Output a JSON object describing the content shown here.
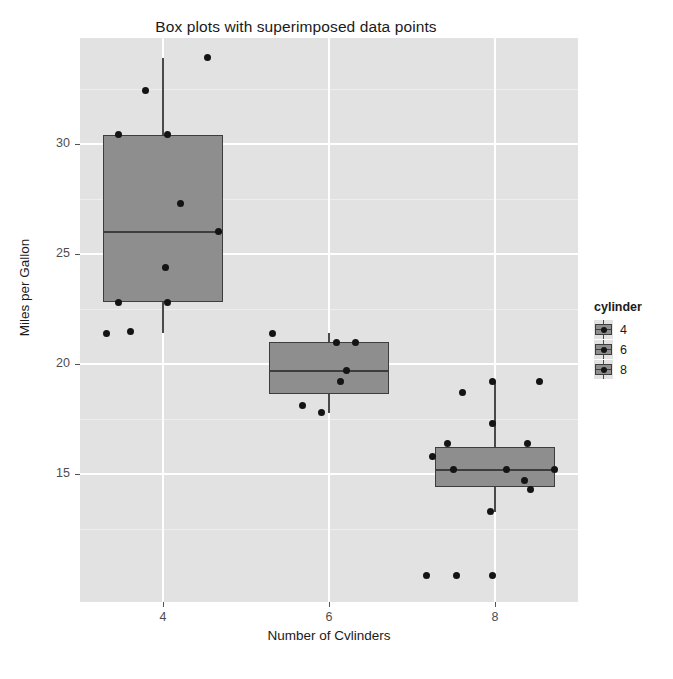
{
  "chart_data": {
    "type": "box",
    "title": "Box plots with superimposed data points",
    "xlabel": "Number of Cvlinders",
    "ylabel": "Miles per Gallon",
    "categories": [
      "4",
      "6",
      "8"
    ],
    "xtick_labels": [
      "4",
      "6",
      "8"
    ],
    "ytick_labels": [
      "15",
      "20",
      "25",
      "30"
    ],
    "ytick_values": [
      15,
      20,
      25,
      30
    ],
    "ylim": [
      9.2,
      34.8
    ],
    "grid": "white major and minor horizontal gridlines on grey panel",
    "legend": {
      "title": "cylinder",
      "position": "right",
      "entries": [
        "4",
        "6",
        "8"
      ]
    },
    "colors": {
      "panel_background": "#e2e2e2",
      "gridline_major": "#ffffff",
      "gridline_minor": "#eeeeee",
      "box_fill": "#8e8e8e",
      "box_outline": "#3d3d3d",
      "point": "#141414",
      "text": "#1a1a1a",
      "axis_text": "#4d4d4d"
    },
    "boxes": [
      {
        "category": "4",
        "lower_whisker": 21.4,
        "q1": 22.8,
        "median": 26.0,
        "q3": 30.4,
        "upper_whisker": 33.9,
        "points": [
          {
            "x_offset": -0.3,
            "y": 22.8
          },
          {
            "x_offset": -0.38,
            "y": 21.4
          },
          {
            "x_offset": -0.22,
            "y": 21.5
          },
          {
            "x_offset": -0.3,
            "y": 30.4
          },
          {
            "x_offset": -0.12,
            "y": 32.4
          },
          {
            "x_offset": 0.03,
            "y": 30.4
          },
          {
            "x_offset": 0.03,
            "y": 22.8
          },
          {
            "x_offset": 0.12,
            "y": 27.3
          },
          {
            "x_offset": 0.02,
            "y": 24.4
          },
          {
            "x_offset": 0.3,
            "y": 33.9
          },
          {
            "x_offset": 0.37,
            "y": 26.0
          }
        ]
      },
      {
        "category": "6",
        "lower_whisker": 17.8,
        "q1": 18.65,
        "median": 19.7,
        "q3": 21.0,
        "upper_whisker": 21.4,
        "points": [
          {
            "x_offset": -0.38,
            "y": 21.4
          },
          {
            "x_offset": 0.05,
            "y": 21.0
          },
          {
            "x_offset": 0.18,
            "y": 21.0
          },
          {
            "x_offset": 0.12,
            "y": 19.7
          },
          {
            "x_offset": 0.08,
            "y": 19.2
          },
          {
            "x_offset": -0.18,
            "y": 18.1
          },
          {
            "x_offset": -0.05,
            "y": 17.8
          }
        ]
      },
      {
        "category": "8",
        "lower_whisker": 13.3,
        "q1": 14.4,
        "median": 15.2,
        "q3": 16.25,
        "upper_whisker": 19.2,
        "points": [
          {
            "x_offset": -0.42,
            "y": 15.8
          },
          {
            "x_offset": -0.32,
            "y": 16.4
          },
          {
            "x_offset": -0.28,
            "y": 15.2
          },
          {
            "x_offset": -0.22,
            "y": 18.7
          },
          {
            "x_offset": -0.02,
            "y": 19.2
          },
          {
            "x_offset": -0.02,
            "y": 17.3
          },
          {
            "x_offset": -0.03,
            "y": 13.3
          },
          {
            "x_offset": 0.08,
            "y": 15.2
          },
          {
            "x_offset": 0.22,
            "y": 16.4
          },
          {
            "x_offset": 0.2,
            "y": 14.7
          },
          {
            "x_offset": 0.24,
            "y": 14.3
          },
          {
            "x_offset": 0.3,
            "y": 19.2
          },
          {
            "x_offset": 0.4,
            "y": 15.2
          },
          {
            "x_offset": -0.46,
            "y": 10.4
          },
          {
            "x_offset": -0.26,
            "y": 10.4
          },
          {
            "x_offset": -0.02,
            "y": 10.4
          }
        ]
      }
    ]
  }
}
